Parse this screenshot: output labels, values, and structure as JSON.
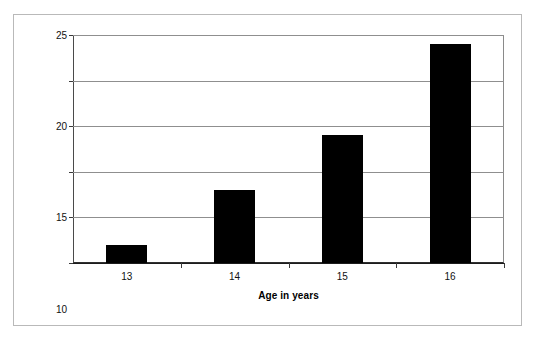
{
  "chart_data": {
    "type": "bar",
    "title": "",
    "subtitle": "",
    "categories": [
      "13",
      "14",
      "15",
      "16"
    ],
    "values": [
      2,
      8,
      14,
      24
    ],
    "xlabel": "Age in years",
    "ylabel": "Number of Suicides",
    "ylim": [
      0,
      25
    ],
    "yticks": [
      "0",
      "5",
      "10",
      "15",
      "20",
      "25"
    ],
    "ytick_values": [
      0,
      5,
      10,
      15,
      20,
      25
    ],
    "grid": "horizontal",
    "legend": "none",
    "annotations": [],
    "series": [
      {
        "name": "Number of Suicides",
        "values": [
          2,
          8,
          14,
          24
        ],
        "color": "#000000"
      }
    ]
  },
  "style": {
    "bar_color": "#000000",
    "gridline_color": "#8f8f8f",
    "axis_color": "#303030",
    "frame_color": "#b9b9b9",
    "background": "#ffffff",
    "text_color": "#111111"
  }
}
